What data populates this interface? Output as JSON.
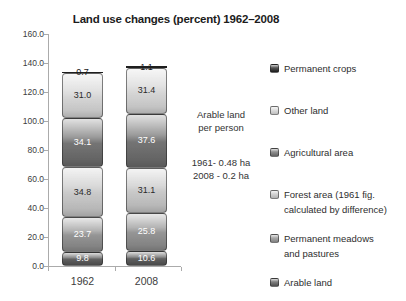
{
  "title": "Land use changes (percent) 1962–2008",
  "annotation": {
    "heading_line1": "Arable land",
    "heading_line2": "per person",
    "value_line1": "1961- 0.48 ha",
    "value_line2": "2008 - 0.2 ha"
  },
  "chart_data": {
    "type": "bar",
    "subtype": "stacked-vertical-glossy",
    "title": "Land use changes (percent) 1962–2008",
    "categories": [
      "1962",
      "2008"
    ],
    "series": [
      {
        "name": "Arable land",
        "values": [
          9.8,
          10.6
        ],
        "color": "#585858",
        "label_color": "#ffffff"
      },
      {
        "name": "Permanent meadows and pastures",
        "values": [
          23.7,
          25.8
        ],
        "color": "#8f8f8f",
        "label_color": "#ffffff"
      },
      {
        "name": "Forest area (1961 fig. calculated by difference)",
        "values": [
          34.8,
          31.1
        ],
        "color": "#c7c7c7",
        "label_color": "#2a2a2a"
      },
      {
        "name": "Agricultural area",
        "values": [
          34.1,
          37.6
        ],
        "color": "#6d6d6d",
        "label_color": "#ffffff"
      },
      {
        "name": "Other land",
        "values": [
          31.0,
          31.4
        ],
        "color": "#d5d5d5",
        "label_color": "#2a2a2a"
      },
      {
        "name": "Permanent crops",
        "values": [
          0.7,
          1.1
        ],
        "color": "#1e1e1e",
        "label_color": "#1a1a1a"
      }
    ],
    "totals": [
      134.1,
      137.6
    ],
    "ylim": [
      0,
      160
    ],
    "ytick_step": 20,
    "ytick_label_decimals": 1,
    "grid": false,
    "data_labels": true,
    "legend_position": "right",
    "stack_order": "bottom-to-top"
  },
  "legend": {
    "items": [
      {
        "lines": [
          "Permanent crops"
        ],
        "color": "#1e1e1e"
      },
      {
        "lines": [
          "Other land"
        ],
        "color": "#d5d5d5"
      },
      {
        "lines": [
          "Agricultural area"
        ],
        "color": "#6d6d6d"
      },
      {
        "lines": [
          "Forest area (1961 fig.",
          "calculated by difference)"
        ],
        "color": "#c7c7c7"
      },
      {
        "lines": [
          "Permanent meadows",
          "and pastures"
        ],
        "color": "#8f8f8f"
      },
      {
        "lines": [
          "Arable land"
        ],
        "color": "#585858"
      }
    ]
  }
}
